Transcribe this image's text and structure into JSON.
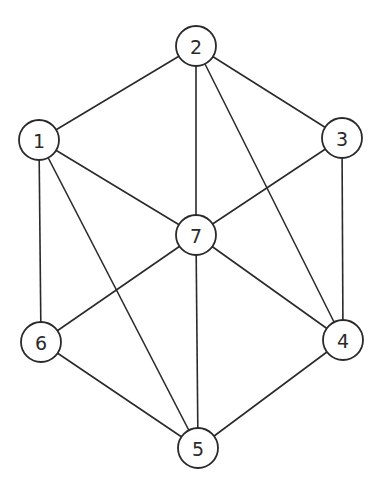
{
  "graph": {
    "node_radius": 20,
    "stroke_color": "#2a2a2a",
    "background": "#ffffff",
    "nodes": [
      {
        "id": "1",
        "label": "1",
        "x": 39,
        "y": 140
      },
      {
        "id": "2",
        "label": "2",
        "x": 196,
        "y": 46
      },
      {
        "id": "3",
        "label": "3",
        "x": 342,
        "y": 138
      },
      {
        "id": "4",
        "label": "4",
        "x": 343,
        "y": 340
      },
      {
        "id": "5",
        "label": "5",
        "x": 198,
        "y": 448
      },
      {
        "id": "6",
        "label": "6",
        "x": 41,
        "y": 342
      },
      {
        "id": "7",
        "label": "7",
        "x": 196,
        "y": 235
      }
    ],
    "edges": [
      [
        "1",
        "2"
      ],
      [
        "2",
        "3"
      ],
      [
        "2",
        "7"
      ],
      [
        "2",
        "4"
      ],
      [
        "1",
        "7"
      ],
      [
        "1",
        "6"
      ],
      [
        "1",
        "5"
      ],
      [
        "3",
        "7"
      ],
      [
        "3",
        "4"
      ],
      [
        "7",
        "6"
      ],
      [
        "7",
        "5"
      ],
      [
        "7",
        "4"
      ],
      [
        "6",
        "5"
      ],
      [
        "4",
        "5"
      ]
    ]
  }
}
